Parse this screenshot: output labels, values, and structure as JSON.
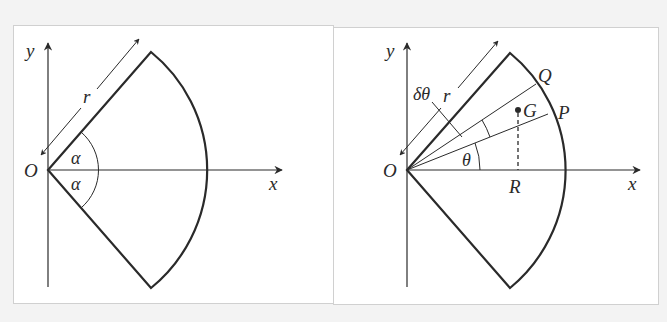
{
  "figure": {
    "left": {
      "axes": {
        "x_label": "x",
        "y_label": "y",
        "origin_label": "O"
      },
      "radius_label": "r",
      "angle_upper_label": "α",
      "angle_lower_label": "α",
      "description": "Sector of radius r with half-angle α, symmetric about the x-axis"
    },
    "right": {
      "axes": {
        "x_label": "x",
        "y_label": "y",
        "origin_label": "O"
      },
      "radius_label": "r",
      "small_angle_label": "δθ",
      "angle_label": "θ",
      "point_p_label": "P",
      "point_q_label": "Q",
      "centroid_label": "G",
      "foot_label": "R",
      "description": "Same sector with an elemental slice OPQ of angle δθ at angle θ; G is its centroid, R the foot of the perpendicular from G to the x-axis"
    }
  },
  "colors": {
    "line": "#2a2a2a",
    "background": "#ffffff",
    "frame": "#d0d0d0",
    "page": "#f3f3f3"
  }
}
